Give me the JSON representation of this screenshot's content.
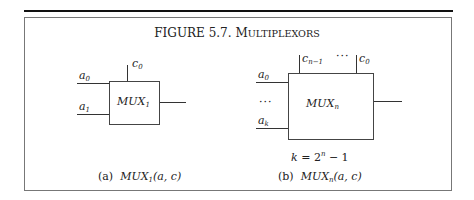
{
  "figure": {
    "number": "FIGURE 5.7.",
    "title": "Multiplexors"
  },
  "diagram_a": {
    "box_label": "MUX",
    "box_subscript": "1",
    "control_inputs": [
      {
        "base": "c",
        "sub": "0"
      }
    ],
    "data_inputs": [
      {
        "base": "a",
        "sub": "0"
      },
      {
        "base": "a",
        "sub": "1"
      }
    ],
    "caption_tag": "(a)",
    "caption_func": "MUX",
    "caption_sub": "1",
    "caption_args": "(a, c)"
  },
  "diagram_b": {
    "box_label": "MUX",
    "box_subscript": "n",
    "control_inputs": [
      {
        "base": "c",
        "sub": "n−1"
      },
      {
        "base": "c",
        "sub": "0"
      }
    ],
    "control_ellipsis": "···",
    "data_inputs": [
      {
        "base": "a",
        "sub": "0"
      },
      {
        "base": "a",
        "sub": "k"
      }
    ],
    "data_ellipsis": "···",
    "equation": {
      "lhs": "k = 2",
      "exp": "n",
      "rhs": " − 1"
    },
    "caption_tag": "(b)",
    "caption_func": "MUX",
    "caption_sub": "n",
    "caption_args": "(a, c)"
  }
}
